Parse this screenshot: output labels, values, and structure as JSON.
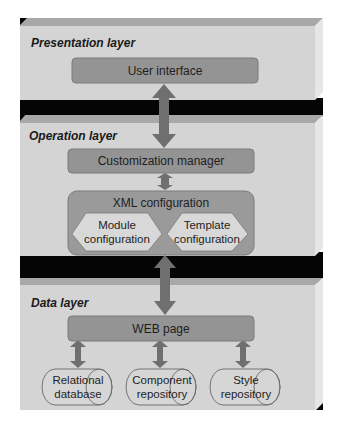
{
  "colors": {
    "slab_face": "#d4d4d4",
    "slab_top_edge": "#a8a8a8",
    "slab_side": "#e6e6e6",
    "band": "#050505",
    "box_fill": "#949494",
    "box_stroke": "#7a7a7a",
    "xml_fill": "#9a9a9a",
    "hex_fill": "#d8d8d8",
    "arrow": "#6f6f6f",
    "cylinder_fill": "#d6d6d6",
    "cylinder_stroke": "#6a6a6a"
  },
  "layers": [
    {
      "id": "presentation",
      "title": "Presentation layer"
    },
    {
      "id": "operation",
      "title": "Operation layer"
    },
    {
      "id": "data",
      "title": "Data layer"
    }
  ],
  "nodes": {
    "user_interface": "User interface",
    "customization_manager": "Customization manager",
    "xml_configuration": "XML configuration",
    "module_configuration": [
      "Module",
      "configuration"
    ],
    "template_configuration": [
      "Template",
      "configuration"
    ],
    "web_page": "WEB page",
    "relational_database": [
      "Relational",
      "database"
    ],
    "component_repository": [
      "Component",
      "repository"
    ],
    "style_repository": [
      "Style",
      "repository"
    ]
  },
  "edges": [
    {
      "from": "user_interface",
      "to": "customization_manager",
      "type": "bidirectional"
    },
    {
      "from": "customization_manager",
      "to": "xml_configuration",
      "type": "bidirectional"
    },
    {
      "from": "xml_configuration",
      "to": "web_page",
      "type": "bidirectional"
    },
    {
      "from": "web_page",
      "to": "relational_database",
      "type": "bidirectional"
    },
    {
      "from": "web_page",
      "to": "component_repository",
      "type": "bidirectional"
    },
    {
      "from": "web_page",
      "to": "style_repository",
      "type": "bidirectional"
    }
  ]
}
